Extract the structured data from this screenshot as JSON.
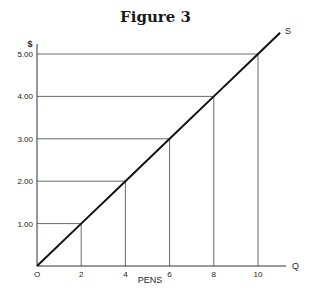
{
  "page": {
    "cut_off_text": "",
    "title": "Figure 3"
  },
  "chart_data": {
    "type": "line",
    "title": "Figure 3",
    "xlabel": "PENS",
    "ylabel": "$",
    "x_axis_end_label": "Q",
    "series": [
      {
        "name": "S",
        "x": [
          0,
          2,
          4,
          6,
          8,
          10,
          11
        ],
        "y": [
          0,
          1.0,
          2.0,
          3.0,
          4.0,
          5.0,
          5.5
        ]
      }
    ],
    "marked_points": [
      {
        "x": 2,
        "y": 1.0
      },
      {
        "x": 4,
        "y": 2.0
      },
      {
        "x": 6,
        "y": 3.0
      },
      {
        "x": 8,
        "y": 4.0
      },
      {
        "x": 10,
        "y": 5.0
      }
    ],
    "x_ticks": [
      "O",
      "2",
      "4",
      "6",
      "8",
      "10"
    ],
    "y_ticks": [
      "1.00",
      "2.00",
      "3.00",
      "4.00",
      "5.00"
    ],
    "xlim": [
      0,
      11
    ],
    "ylim": [
      0,
      5.5
    ],
    "grid": false,
    "legend": "none; series labeled inline as 'S' at line end",
    "annotations": [
      "Dashed-free guide lines drop from each marked point to both axes"
    ]
  },
  "style": {
    "line_color": "#111111",
    "guide_color": "#444444",
    "axis_color": "#333333"
  }
}
